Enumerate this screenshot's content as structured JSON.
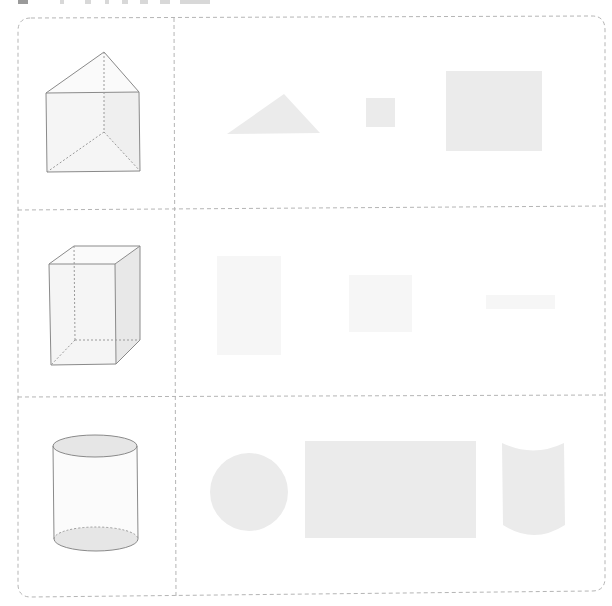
{
  "worksheet": {
    "title_strip": {
      "note": "cropped, illegible header fragments"
    },
    "grid": {
      "frame": {
        "x": 17,
        "y": 17,
        "width": 588,
        "height": 580,
        "corner_radius": 14
      },
      "column_divider_x": 174,
      "row_divider_y": [
        209,
        396
      ],
      "line_color": "#b8b8b8"
    },
    "rows": [
      {
        "solid": "triangular-prism",
        "parts": [
          {
            "shape": "triangle",
            "desc": "triangular base face"
          },
          {
            "shape": "small-square",
            "desc": "small square face"
          },
          {
            "shape": "rectangle",
            "desc": "rectangular side face"
          }
        ]
      },
      {
        "solid": "rectangular-prism",
        "parts": [
          {
            "shape": "tall-rectangle",
            "desc": "faint tall rectangle"
          },
          {
            "shape": "square",
            "desc": "faint square"
          },
          {
            "shape": "thin-bar",
            "desc": "faint thin rectangle"
          }
        ]
      },
      {
        "solid": "cylinder",
        "parts": [
          {
            "shape": "circle",
            "desc": "circular base"
          },
          {
            "shape": "rectangle",
            "desc": "unrolled lateral surface"
          },
          {
            "shape": "curved-surface",
            "desc": "curved lateral surface"
          }
        ]
      }
    ],
    "colors": {
      "shape_fill": "#ebebeb",
      "faint_fill": "#f6f6f6",
      "solid_edge": "#8a8a8a",
      "solid_face": "#f4f4f4",
      "solid_side": "#ececec",
      "dash": "#b5b5b5"
    }
  }
}
